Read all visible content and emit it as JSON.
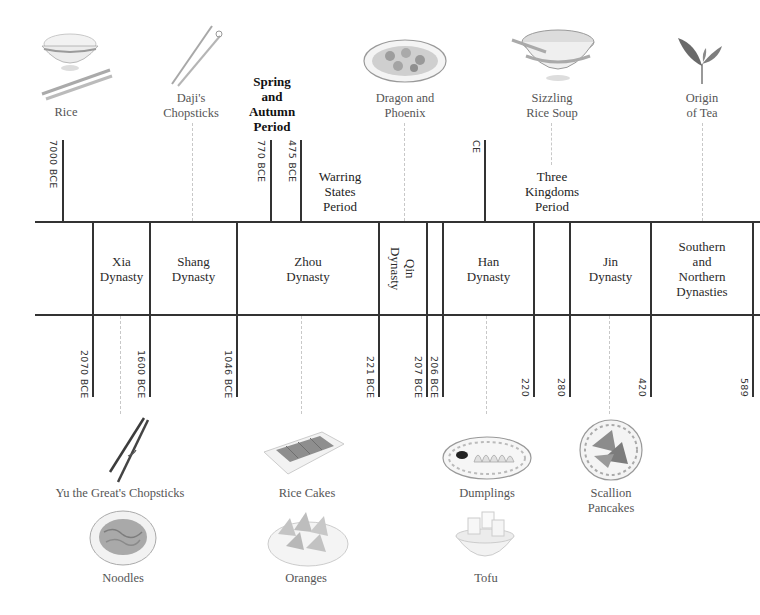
{
  "timeline": {
    "title": "Chinese Dynasties and Food Origins Timeline",
    "dynasties": [
      {
        "name": "Xia\nDynasty",
        "label": "Xia Dynasty",
        "start": "2070 BCE",
        "end": "1600 BCE"
      },
      {
        "name": "Shang Dynasty",
        "label": "Shang Dynasty",
        "start": "1600 BCE",
        "end": "1046 BCE"
      },
      {
        "name": "Zhou Dynasty",
        "label": "Zhou Dynasty",
        "start": "1046 BCE",
        "end": "221 BCE"
      },
      {
        "name": "Qin Dynasty",
        "label": "Qin Dynasty",
        "start": "221 BCE",
        "end": "207 BCE"
      },
      {
        "name": "Han Dynasty",
        "label": "Han Dynasty",
        "start": "206 BCE",
        "end": "220"
      },
      {
        "name": "Jin Dynasty",
        "label": "Jin Dynasty",
        "start": "280",
        "end": "420"
      },
      {
        "name": "Southern and Northern Dynasties",
        "label": "Southern and Northern Dynasties",
        "start": "420",
        "end": "589"
      }
    ],
    "periods": [
      {
        "label": "Spring and Autumn Period",
        "start": "770 BCE",
        "end": "475 BCE"
      },
      {
        "label": "Warring States Period",
        "start": "475 BCE",
        "end": "221 BCE"
      },
      {
        "label": "Three Kingdoms Period",
        "start": "220",
        "end": "280"
      }
    ],
    "top_dates": [
      "7000 BCE",
      "770 BCE",
      "475 BCE",
      "CE"
    ],
    "bottom_dates": [
      "2070 BCE",
      "1600 BCE",
      "1046 BCE",
      "221 BCE",
      "207 BCE",
      "206 BCE",
      "220",
      "280",
      "420",
      "589"
    ],
    "foods_top": [
      {
        "label": "Rice",
        "icon": "rice-bowl-icon"
      },
      {
        "label": "Daji's Chopsticks",
        "icon": "chopsticks-icon"
      },
      {
        "label": "Dragon and Phoenix",
        "icon": "dish-platter-icon"
      },
      {
        "label": "Sizzling Rice Soup",
        "icon": "soup-bowl-icon"
      },
      {
        "label": "Origin of Tea",
        "icon": "tea-leaf-icon"
      }
    ],
    "foods_bottom": [
      {
        "label": "Yu the Great's Chopsticks",
        "icon": "chopsticks-icon"
      },
      {
        "label": "Noodles",
        "icon": "noodles-plate-icon"
      },
      {
        "label": "Rice Cakes",
        "icon": "rice-cakes-icon"
      },
      {
        "label": "Oranges",
        "icon": "oranges-plate-icon"
      },
      {
        "label": "Dumplings",
        "icon": "dumplings-plate-icon"
      },
      {
        "label": "Tofu",
        "icon": "tofu-bowl-icon"
      },
      {
        "label": "Scallion Pancakes",
        "icon": "pancakes-plate-icon"
      }
    ]
  },
  "text": {
    "xia_1": "Xia",
    "xia_2": "Dynasty",
    "shang_1": "Shang",
    "shang_2": "Dynasty",
    "zhou_1": "Zhou",
    "zhou_2": "Dynasty",
    "qin_1": "Qin",
    "qin_2": "Dynasty",
    "han_1": "Han",
    "han_2": "Dynasty",
    "jin_1": "Jin",
    "jin_2": "Dynasty",
    "sn_1": "Southern",
    "sn_2": "and",
    "sn_3": "Northern",
    "sn_4": "Dynasties",
    "sa_1": "Spring",
    "sa_2": "and",
    "sa_3": "Autumn",
    "sa_4": "Period",
    "ws_1": "Warring",
    "ws_2": "States",
    "ws_3": "Period",
    "tk_1": "Three",
    "tk_2": "Kingdoms",
    "tk_3": "Period",
    "rice": "Rice",
    "daji_1": "Daji's",
    "daji_2": "Chopsticks",
    "dp_1": "Dragon and",
    "dp_2": "Phoenix",
    "srs_1": "Sizzling",
    "srs_2": "Rice Soup",
    "tea_1": "Origin",
    "tea_2": "of Tea",
    "yu": "Yu the Great's Chopsticks",
    "noodles": "Noodles",
    "ricecakes": "Rice Cakes",
    "oranges": "Oranges",
    "dumplings": "Dumplings",
    "tofu": "Tofu",
    "sp_1": "Scallion",
    "sp_2": "Pancakes",
    "d7000": "7000 BCE",
    "d770": "770 BCE",
    "d475": "475 BCE",
    "dce": "CE",
    "d2070": "2070 BCE",
    "d1600": "1600 BCE",
    "d1046": "1046 BCE",
    "d221": "221 BCE",
    "d207": "207 BCE",
    "d206": "206 BCE",
    "d220": "220",
    "d280": "280",
    "d420": "420",
    "d589": "589"
  }
}
